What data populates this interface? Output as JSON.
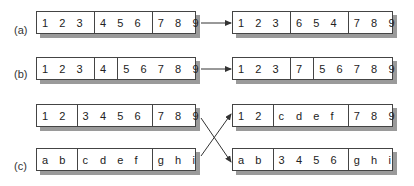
{
  "labels": {
    "a": "(a)",
    "b": "(b)",
    "c": "(c)"
  },
  "rows": {
    "a_left": {
      "segments": [
        [
          "1",
          "2",
          "3"
        ],
        [
          "4",
          "5",
          "6"
        ],
        [
          "7",
          "8",
          "9"
        ]
      ]
    },
    "a_right": {
      "segments": [
        [
          "1",
          "2",
          "3"
        ],
        [
          "6",
          "5",
          "4"
        ],
        [
          "7",
          "8",
          "9"
        ]
      ]
    },
    "b_left": {
      "segments": [
        [
          "1",
          "2",
          "3"
        ],
        [
          "4"
        ],
        [
          "5",
          "6",
          "7",
          "8",
          "9"
        ]
      ]
    },
    "b_right": {
      "segments": [
        [
          "1",
          "2",
          "3"
        ],
        [
          "7"
        ],
        [
          "5",
          "6",
          "7",
          "8",
          "9"
        ]
      ]
    },
    "c_left_top": {
      "segments": [
        [
          "1",
          "2"
        ],
        [
          "3",
          "4",
          "5",
          "6"
        ],
        [
          "7",
          "8",
          "9"
        ]
      ]
    },
    "c_left_bottom": {
      "segments": [
        [
          "a",
          "b"
        ],
        [
          "c",
          "d",
          "e",
          "f"
        ],
        [
          "g",
          "h",
          "i"
        ]
      ]
    },
    "c_right_top": {
      "segments": [
        [
          "1",
          "2"
        ],
        [
          "c",
          "d",
          "e",
          "f"
        ],
        [
          "7",
          "8",
          "9"
        ]
      ]
    },
    "c_right_bottom": {
      "segments": [
        [
          "a",
          "b"
        ],
        [
          "3",
          "4",
          "5",
          "6"
        ],
        [
          "g",
          "h",
          "i"
        ]
      ]
    }
  },
  "colors": {
    "border": "#444444",
    "shadow": "#9a9a9a",
    "arrow": "#333333"
  }
}
